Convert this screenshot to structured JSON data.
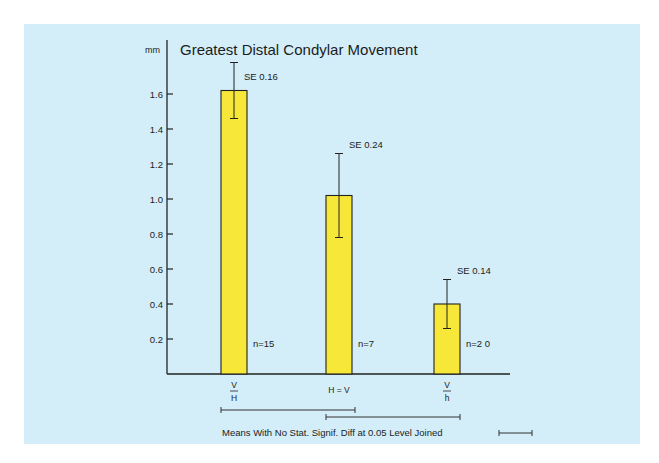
{
  "chart_data": {
    "type": "bar",
    "title": "Greatest Distal Condylar Movement",
    "ylabel": "mm",
    "xlabel": "",
    "ylim": [
      0,
      1.8
    ],
    "yticks": [
      0.2,
      0.4,
      0.6,
      0.8,
      1.0,
      1.2,
      1.4,
      1.6
    ],
    "ytick_labels": [
      "0.2",
      "0.4",
      "0.6",
      "0.8",
      "1.0",
      "1.2",
      "1.4",
      "1.6"
    ],
    "grid": false,
    "categories": [
      {
        "num": "V",
        "den": "H",
        "label": "V/H"
      },
      {
        "label": "H = V"
      },
      {
        "num": "V",
        "den": "h",
        "label": "V/h"
      }
    ],
    "values": [
      1.62,
      1.02,
      0.4
    ],
    "se": [
      0.16,
      0.24,
      0.14
    ],
    "se_labels": [
      "SE 0.16",
      "SE 0.24",
      "SE 0.14"
    ],
    "n_labels": [
      "n=15",
      "n=7",
      "n=2 0"
    ],
    "bar_color": "#f7e739",
    "background_color": "#d3eef8",
    "significance_groups": [
      {
        "from": 0,
        "to": 1
      },
      {
        "from": 1,
        "to": 2
      }
    ],
    "legend": "Means With No Stat. Signif. Diff at 0.05 Level Joined"
  }
}
